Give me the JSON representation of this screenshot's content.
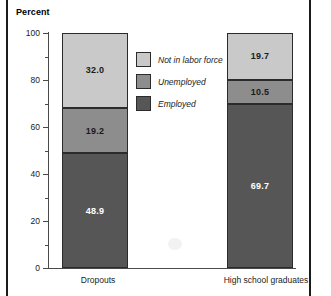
{
  "chart_data": {
    "type": "bar",
    "subtype": "stacked-percent",
    "title": "",
    "ylabel": "Percent",
    "xlabel": "",
    "ylim": [
      0,
      100
    ],
    "ytick_labels": [
      "0",
      "20",
      "40",
      "60",
      "80",
      "100"
    ],
    "ytick_values": [
      0,
      20,
      40,
      60,
      80,
      100
    ],
    "yminor_values": [
      10,
      30,
      50,
      70,
      90
    ],
    "grid": false,
    "legend_position": "center",
    "categories": [
      "Dropouts",
      "High school graduates"
    ],
    "series": [
      {
        "name": "Employed",
        "color": "#565656",
        "value_color": "#ffffff",
        "values": [
          48.9,
          69.7
        ],
        "labels": [
          "48.9",
          "69.7"
        ]
      },
      {
        "name": "Unemployed",
        "color": "#8d8d8d",
        "value_color": "#1b1b1b",
        "values": [
          19.2,
          10.5
        ],
        "labels": [
          "19.2",
          "10.5"
        ]
      },
      {
        "name": "Not in labor force",
        "color": "#c9c9c9",
        "value_color": "#1b1b1b",
        "values": [
          32.0,
          19.7
        ],
        "labels": [
          "32.0",
          "19.7"
        ]
      }
    ]
  },
  "axis": {
    "y_title": "Percent",
    "ticks": [
      {
        "label": "100",
        "value": 100
      },
      {
        "label": "80",
        "value": 80
      },
      {
        "label": "60",
        "value": 60
      },
      {
        "label": "40",
        "value": 40
      },
      {
        "label": "20",
        "value": 20
      },
      {
        "label": "0",
        "value": 0
      }
    ]
  },
  "categories": {
    "left": "Dropouts",
    "right": "High school graduates"
  },
  "legend": {
    "items": [
      {
        "label": "Not in labor force",
        "color": "#c9c9c9"
      },
      {
        "label": "Unemployed",
        "color": "#8d8d8d"
      },
      {
        "label": "Employed",
        "color": "#565656"
      }
    ]
  },
  "bars": {
    "dropouts": {
      "not_in_labor_force": "32.0",
      "unemployed": "19.2",
      "employed": "48.9"
    },
    "hs_graduates": {
      "not_in_labor_force": "19.7",
      "unemployed": "10.5",
      "employed": "69.7"
    }
  },
  "colors": {
    "not_in_labor_force": "#c9c9c9",
    "unemployed": "#8d8d8d",
    "employed": "#565656",
    "axis": "#4a4a4a",
    "outline": "#2b2b2b",
    "frame": "#1b1b1b"
  }
}
